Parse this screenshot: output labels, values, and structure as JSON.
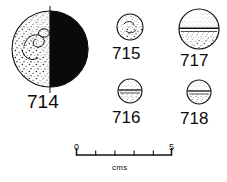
{
  "plate": {
    "kind": "archaeological-finds-plate",
    "medium": "ink line drawing",
    "background_color": "#ffffff",
    "ink_color": "#101010"
  },
  "objects": [
    {
      "catalogue_number": "714",
      "shape": "sphere-bead",
      "rendering": "left half stippled, right half solid black fill",
      "has_vertical_axis_line": true,
      "has_equator_line": false,
      "surface_motif": "incised loop / spiral marking on stippled half",
      "size_class": "large",
      "center_x": 50,
      "center_y": 49,
      "radius": 38
    },
    {
      "catalogue_number": "715",
      "shape": "sphere-bead",
      "rendering": "outline with light stipple",
      "has_vertical_axis_line": false,
      "has_equator_line": false,
      "surface_motif": "scattered stipple flecks",
      "size_class": "small",
      "center_x": 130,
      "center_y": 27,
      "radius": 13
    },
    {
      "catalogue_number": "716",
      "shape": "sphere-bead",
      "rendering": "outline with stipple and horizontal equator band",
      "has_vertical_axis_line": false,
      "has_equator_line": true,
      "surface_motif": "equatorial groove",
      "size_class": "small",
      "center_x": 130,
      "center_y": 91,
      "radius": 12
    },
    {
      "catalogue_number": "717",
      "shape": "sphere-bead",
      "rendering": "outline with stipple and horizontal equator line above centre",
      "has_vertical_axis_line": false,
      "has_equator_line": true,
      "surface_motif": "equatorial groove with stipple above and below",
      "size_class": "medium",
      "center_x": 199,
      "center_y": 29,
      "radius": 20
    },
    {
      "catalogue_number": "718",
      "shape": "sphere-bead",
      "rendering": "outline with stipple and horizontal equator band",
      "has_vertical_axis_line": false,
      "has_equator_line": true,
      "surface_motif": "equatorial groove",
      "size_class": "small",
      "center_x": 199,
      "center_y": 92,
      "radius": 12
    }
  ],
  "scale_bar": {
    "start_label": "0",
    "end_label": "5",
    "unit_label": "cms",
    "major_divisions": 5,
    "tick_count": 6,
    "bar_left_x": 76,
    "bar_right_x": 172,
    "bar_y": 155
  }
}
